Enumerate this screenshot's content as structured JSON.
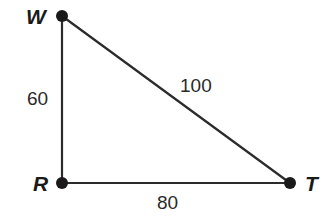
{
  "diagram": {
    "type": "right-triangle",
    "vertices": [
      {
        "id": "W",
        "label": "W",
        "x": 62,
        "y": 16
      },
      {
        "id": "R",
        "label": "R",
        "x": 62,
        "y": 183
      },
      {
        "id": "T",
        "label": "T",
        "x": 290,
        "y": 183
      }
    ],
    "sides": [
      {
        "from": "W",
        "to": "R",
        "label": "60"
      },
      {
        "from": "W",
        "to": "T",
        "label": "100"
      },
      {
        "from": "R",
        "to": "T",
        "label": "80"
      }
    ],
    "colors": {
      "line": "#2b2b2b",
      "point": "#1a1a1a",
      "background": "#ffffff"
    }
  }
}
